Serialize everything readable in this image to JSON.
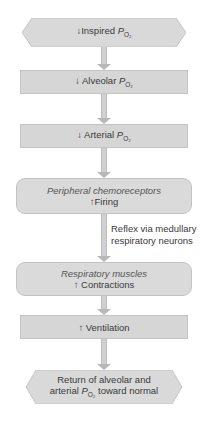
{
  "diagram": {
    "nodes": [
      {
        "id": "inspired",
        "arrow": "↓",
        "text": "Inspired ",
        "var": "P",
        "sub": "O₂",
        "shape": "hexagon"
      },
      {
        "id": "alveolar",
        "arrow": "↓",
        "text": "Alveolar ",
        "var": "P",
        "sub": "O₂",
        "shape": "rectangle"
      },
      {
        "id": "arterial",
        "arrow": "↓",
        "text": "Arterial ",
        "var": "P",
        "sub": "O₂",
        "shape": "rectangle"
      },
      {
        "id": "chemoreceptors",
        "title": "Peripheral chemoreceptors",
        "arrow": "↑",
        "text": "Firing",
        "shape": "rounded"
      },
      {
        "id": "muscles",
        "title": "Respiratory muscles",
        "arrow": "↑",
        "text": "Contractions",
        "shape": "rounded"
      },
      {
        "id": "ventilation",
        "arrow": "↑",
        "text": "Ventilation",
        "shape": "rectangle"
      },
      {
        "id": "return",
        "line1": "Return of alveolar and",
        "line2_pre": "arterial ",
        "var": "P",
        "sub": "O₂",
        "line2_post": " toward normal",
        "shape": "hexagon"
      }
    ],
    "edge_label": {
      "line1": "Reflex via medullary",
      "line2": "respiratory neurons"
    }
  },
  "colors": {
    "box_fill": "#d6d6d6",
    "box_border": "#c4c4c4",
    "text": "#3a3a3a",
    "arrow": "#c8c8c8"
  }
}
